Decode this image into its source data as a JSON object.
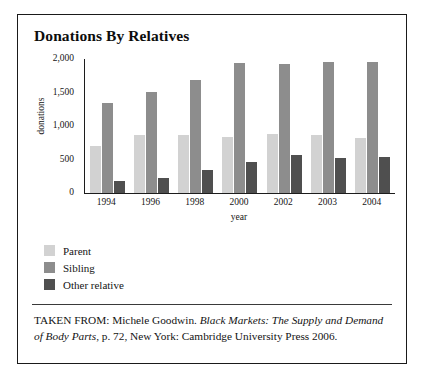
{
  "figure": {
    "title": "Donations By Relatives",
    "caption": {
      "prefix": "TAKEN FROM: Michele Goodwin. ",
      "work_title": "Black Markets: The Supply and Demand of Body Parts",
      "suffix": ", p. 72, New York: Cambridge University Press 2006."
    }
  },
  "colors": {
    "parent": "#d2d2d2",
    "sibling": "#8d8d8d",
    "other_relative": "#4f4f4f",
    "axis": "#1c1c1c",
    "frame": "#1a1a1a"
  },
  "chart_data": {
    "type": "bar",
    "title": "Donations By Relatives",
    "xlabel": "year",
    "ylabel": "donations",
    "categories": [
      "1994",
      "1996",
      "1998",
      "2000",
      "2002",
      "2003",
      "2004"
    ],
    "ylim": [
      0,
      2000
    ],
    "yticks": [
      0,
      500,
      1000,
      1500,
      2000
    ],
    "ytick_labels": [
      "0",
      "500",
      "1,000",
      "1,500",
      "2,000"
    ],
    "grid": false,
    "legend_position": "below-plot-left",
    "series": [
      {
        "name": "Parent",
        "color": "#d2d2d2",
        "values": [
          700,
          860,
          870,
          840,
          880,
          870,
          820
        ]
      },
      {
        "name": "Sibling",
        "color": "#8d8d8d",
        "values": [
          1340,
          1510,
          1680,
          1940,
          1920,
          1960,
          1950
        ]
      },
      {
        "name": "Other relative",
        "color": "#4f4f4f",
        "values": [
          180,
          230,
          340,
          470,
          560,
          520,
          540
        ]
      }
    ]
  }
}
